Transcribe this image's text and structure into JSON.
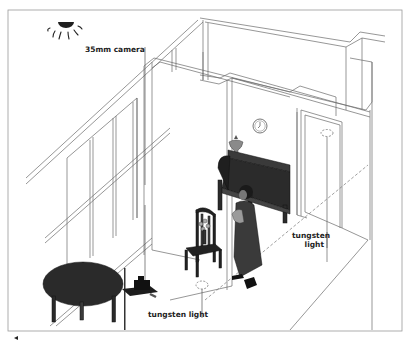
{
  "figure": {
    "type": "isometric room lighting diagram",
    "labels": {
      "camera": "35mm camera",
      "light_right_line1": "tungsten",
      "light_right_line2": "light",
      "light_bottom": "tungsten light"
    },
    "elements": [
      "sun",
      "staircase-railing",
      "doorway",
      "piano",
      "vase",
      "wall-clock",
      "chair-with-flowers",
      "standing-figure",
      "round-table",
      "camera-on-tripod",
      "ceiling-light-right",
      "floor-light-left"
    ],
    "colors": {
      "line": "#555555",
      "fill_dark": "#2b2b2b",
      "background": "#ffffff",
      "frame": "#9a9a9a"
    }
  }
}
